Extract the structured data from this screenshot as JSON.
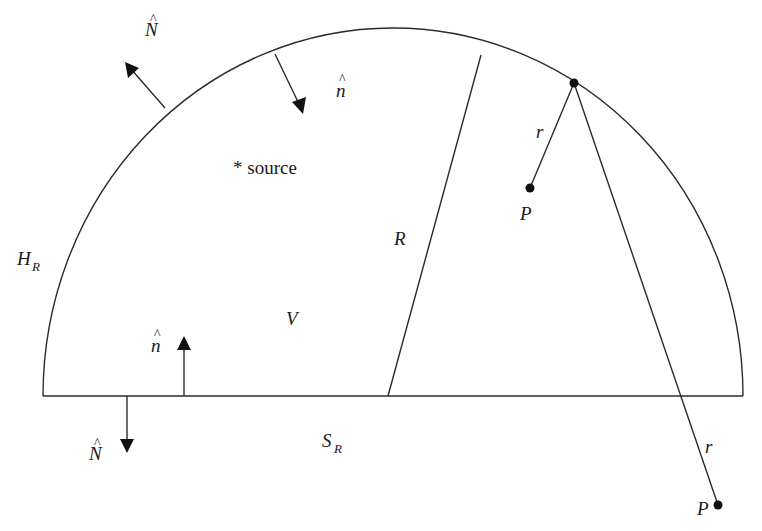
{
  "diagram": {
    "labels": {
      "outer_normal_top": {
        "base": "N",
        "hat": "^"
      },
      "inner_normal_top": {
        "base": "n",
        "hat": "^"
      },
      "source": "* source",
      "hemisphere": {
        "base": "H",
        "sub": "R"
      },
      "radius": "R",
      "volume": "V",
      "inner_normal_bottom": {
        "base": "n",
        "hat": "^"
      },
      "outer_normal_bottom": {
        "base": "N",
        "hat": "^"
      },
      "flat_surface": {
        "base": "S",
        "sub": "R"
      },
      "distance_inner": "r",
      "point_inner": "P",
      "distance_outer": "r",
      "point_outer": "P"
    },
    "colors": {
      "line": "#2b2b2b",
      "fill": "#111111",
      "background": "#ffffff"
    }
  }
}
